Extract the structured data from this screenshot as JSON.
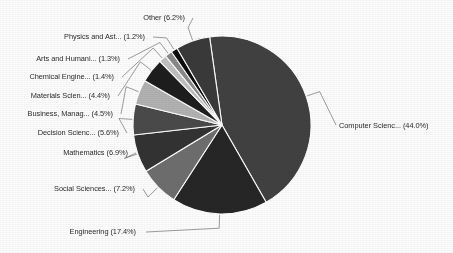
{
  "chart_data": {
    "type": "pie",
    "title": "",
    "subtitle": "",
    "xlabel": "",
    "ylabel": "",
    "legend_position": "none",
    "grid": false,
    "label_format": "{name} ({value}%)",
    "total_percent": 100.0,
    "categories": [
      "Computer Scienc...",
      "Engineering",
      "Social Sciences...",
      "Mathematics",
      "Decision Scienc...",
      "Business, Manag...",
      "Materials Scien...",
      "Chemical Engine...",
      "Arts and Humani...",
      "Physics and Ast...",
      "Other"
    ],
    "values": [
      44.0,
      17.4,
      7.2,
      6.9,
      5.6,
      4.5,
      4.4,
      1.4,
      1.3,
      1.2,
      6.2
    ],
    "colors": [
      "#414141",
      "#262626",
      "#6e6e6e",
      "#333333",
      "#4a4a4a",
      "#b2b2b2",
      "#1e1e1e",
      "#c0c0c0",
      "#8a8a8a",
      "#0d0d0d",
      "#3a3a3a"
    ],
    "slice_separator_color": "#ffffff",
    "start_angle_deg": -8,
    "direction": "clockwise",
    "labels": [
      {
        "name": "Computer Scienc...",
        "value": 44.0,
        "text": "Computer Scienc... (44.0%)"
      },
      {
        "name": "Engineering",
        "value": 17.4,
        "text": "Engineering (17.4%)"
      },
      {
        "name": "Social Sciences...",
        "value": 7.2,
        "text": "Social Sciences... (7.2%)"
      },
      {
        "name": "Mathematics",
        "value": 6.9,
        "text": "Mathematics (6.9%)"
      },
      {
        "name": "Decision Scienc...",
        "value": 5.6,
        "text": "Decision Scienc... (5.6%)"
      },
      {
        "name": "Business, Manag...",
        "value": 4.5,
        "text": "Business, Manag... (4.5%)"
      },
      {
        "name": "Materials Scien...",
        "value": 4.4,
        "text": "Materials Scien... (4.4%)"
      },
      {
        "name": "Chemical Engine...",
        "value": 1.4,
        "text": "Chemical Engine... (1.4%)"
      },
      {
        "name": "Arts and Humani...",
        "value": 1.3,
        "text": "Arts and Humani... (1.3%)"
      },
      {
        "name": "Physics and Ast...",
        "value": 1.2,
        "text": "Physics and Ast... (1.2%)"
      },
      {
        "name": "Other",
        "value": 6.2,
        "text": "Other (6.2%)"
      }
    ]
  },
  "geometry": {
    "center_x": 222,
    "center_y": 125,
    "radius": 89
  },
  "labels_text": {
    "computer_science": "Computer Scienc... (44.0%)",
    "engineering": "Engineering (17.4%)",
    "social_sciences": "Social Sciences... (7.2%)",
    "mathematics": "Mathematics (6.9%)",
    "decision_sciences": "Decision Scienc... (5.6%)",
    "business": "Business, Manag... (4.5%)",
    "materials_science": "Materials Scien... (4.4%)",
    "chemical_engineering": "Chemical Engine... (1.4%)",
    "arts_humanities": "Arts and Humani... (1.3%)",
    "physics_astronomy": "Physics and Ast... (1.2%)",
    "other": "Other (6.2%)"
  }
}
